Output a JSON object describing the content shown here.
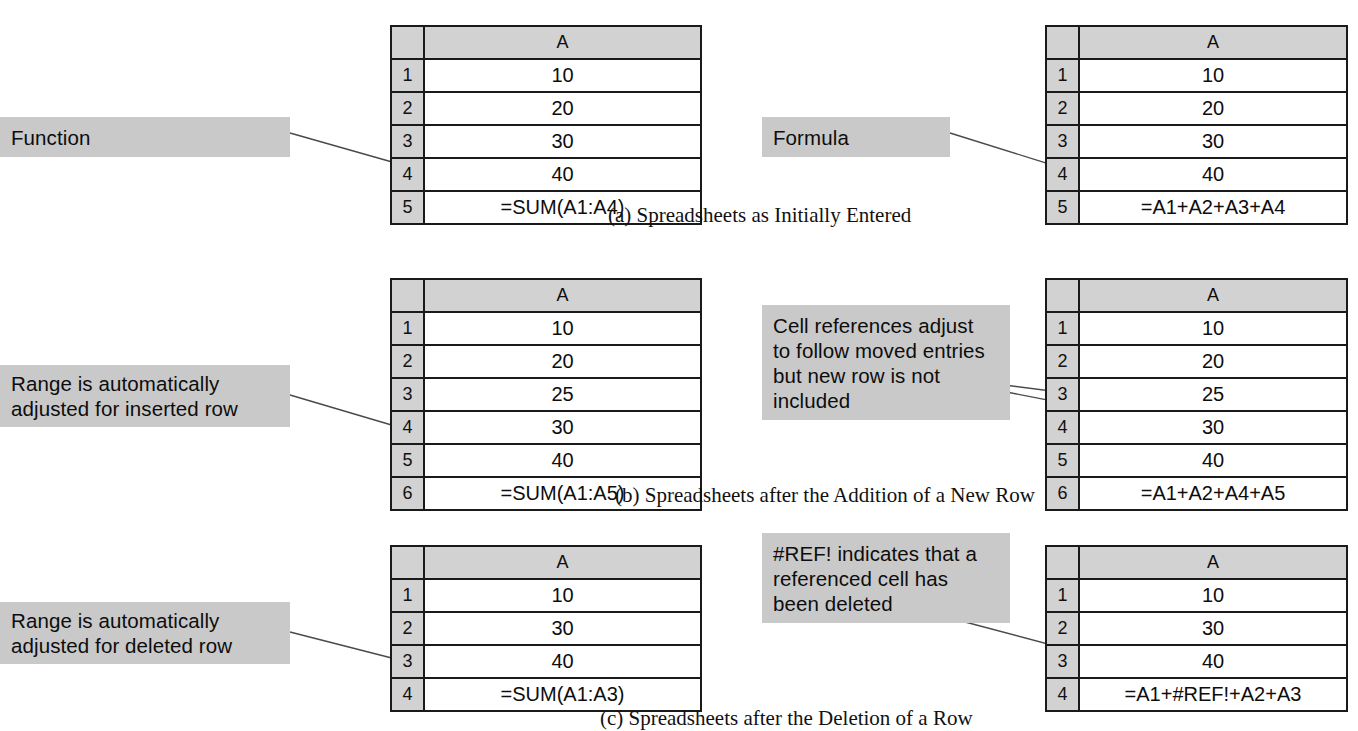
{
  "figure": {
    "background_color": "#ffffff",
    "callout_fill": "#c9c9c9",
    "grid_line_color": "#1a1a1a",
    "row_header_fill": "#d2d2d2"
  },
  "panels": [
    {
      "id": "a",
      "caption": "(a) Spreadsheets as Initially Entered",
      "left": {
        "callout": {
          "lines": [
            "Function"
          ]
        },
        "sheet": {
          "column_header": "A",
          "rows": [
            {
              "number": "1",
              "value": "10"
            },
            {
              "number": "2",
              "value": "20"
            },
            {
              "number": "3",
              "value": "30"
            },
            {
              "number": "4",
              "value": "40"
            },
            {
              "number": "5",
              "value": "=SUM(A1:A4)"
            }
          ]
        }
      },
      "right": {
        "callout": {
          "lines": [
            "Formula"
          ]
        },
        "sheet": {
          "column_header": "A",
          "rows": [
            {
              "number": "1",
              "value": "10"
            },
            {
              "number": "2",
              "value": "20"
            },
            {
              "number": "3",
              "value": "30"
            },
            {
              "number": "4",
              "value": "40"
            },
            {
              "number": "5",
              "value": "=A1+A2+A3+A4"
            }
          ]
        }
      }
    },
    {
      "id": "b",
      "caption": "(b) Spreadsheets after the Addition of a New Row",
      "left": {
        "callout": {
          "lines": [
            "Range is automatically",
            "adjusted for inserted row"
          ]
        },
        "sheet": {
          "column_header": "A",
          "rows": [
            {
              "number": "1",
              "value": "10"
            },
            {
              "number": "2",
              "value": "20"
            },
            {
              "number": "3",
              "value": "25"
            },
            {
              "number": "4",
              "value": "30"
            },
            {
              "number": "5",
              "value": "40"
            },
            {
              "number": "6",
              "value": "=SUM(A1:A5)"
            }
          ]
        }
      },
      "right": {
        "callout": {
          "lines": [
            "Cell references adjust",
            "to follow moved entries",
            "but new row is not",
            "included"
          ]
        },
        "sheet": {
          "column_header": "A",
          "rows": [
            {
              "number": "1",
              "value": "10"
            },
            {
              "number": "2",
              "value": "20"
            },
            {
              "number": "3",
              "value": "25"
            },
            {
              "number": "4",
              "value": "30"
            },
            {
              "number": "5",
              "value": "40"
            },
            {
              "number": "6",
              "value": "=A1+A2+A4+A5"
            }
          ]
        }
      }
    },
    {
      "id": "c",
      "caption": "(c) Spreadsheets after the Deletion of a Row",
      "left": {
        "callout": {
          "lines": [
            "Range is automatically",
            "adjusted for deleted row"
          ]
        },
        "sheet": {
          "column_header": "A",
          "rows": [
            {
              "number": "1",
              "value": "10"
            },
            {
              "number": "2",
              "value": "30"
            },
            {
              "number": "3",
              "value": "40"
            },
            {
              "number": "4",
              "value": "=SUM(A1:A3)"
            }
          ]
        }
      },
      "right": {
        "callout": {
          "lines": [
            "#REF! indicates that a",
            "referenced cell has",
            "been deleted"
          ]
        },
        "sheet": {
          "column_header": "A",
          "rows": [
            {
              "number": "1",
              "value": "10"
            },
            {
              "number": "2",
              "value": "30"
            },
            {
              "number": "3",
              "value": "40"
            },
            {
              "number": "4",
              "value": "=A1+#REF!+A2+A3"
            }
          ]
        }
      }
    }
  ]
}
